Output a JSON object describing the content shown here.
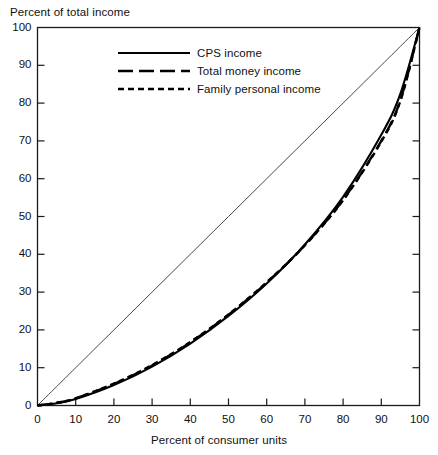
{
  "chart_data": {
    "type": "line",
    "title": "",
    "xlabel": "Percent of consumer units",
    "ylabel": "Percent of total income",
    "xlim": [
      0,
      100
    ],
    "ylim": [
      0,
      100
    ],
    "xticks": [
      0,
      10,
      20,
      30,
      40,
      50,
      60,
      70,
      80,
      90,
      100
    ],
    "yticks": [
      0,
      10,
      20,
      30,
      40,
      50,
      60,
      70,
      80,
      90,
      100
    ],
    "xtick_labels": [
      "0",
      "10",
      "20",
      "30",
      "40",
      "50",
      "60",
      "70",
      "80",
      "90",
      "100"
    ],
    "ytick_labels": [
      "0",
      "10",
      "20",
      "30",
      "40",
      "50",
      "60",
      "70",
      "80",
      "90",
      "100"
    ],
    "grid": false,
    "legend_position": "upper left",
    "x": [
      0,
      5,
      10,
      20,
      30,
      40,
      50,
      60,
      70,
      80,
      90,
      95,
      100
    ],
    "series": [
      {
        "name": "CPS income",
        "style": "solid",
        "color": "#000000",
        "values": [
          0,
          0.6,
          1.7,
          5.4,
          10.3,
          16.4,
          23.7,
          32.3,
          42.6,
          55.2,
          71.6,
          82.5,
          100
        ]
      },
      {
        "name": "Total money income",
        "style": "long-dash",
        "color": "#000000",
        "values": [
          0,
          0.7,
          1.9,
          5.7,
          10.6,
          16.7,
          24.0,
          32.5,
          42.4,
          54.4,
          70.0,
          80.8,
          100
        ]
      },
      {
        "name": "Family personal income",
        "style": "short-dash",
        "color": "#000000",
        "values": [
          0,
          0.7,
          1.9,
          5.8,
          10.7,
          16.8,
          24.1,
          32.6,
          42.4,
          54.3,
          69.8,
          80.6,
          100
        ]
      },
      {
        "name": "Line of equality",
        "style": "thin-solid",
        "color": "#333333",
        "values": [
          0,
          5,
          10,
          20,
          30,
          40,
          50,
          60,
          70,
          80,
          90,
          95,
          100
        ]
      }
    ]
  },
  "axes": {
    "ylabel": "Percent of total income",
    "xlabel": "Percent of consumer units"
  },
  "legend": {
    "items": [
      {
        "label": "CPS income",
        "style": "solid"
      },
      {
        "label": "Total money income",
        "style": "long-dash"
      },
      {
        "label": "Family personal income",
        "style": "short-dash"
      }
    ]
  }
}
